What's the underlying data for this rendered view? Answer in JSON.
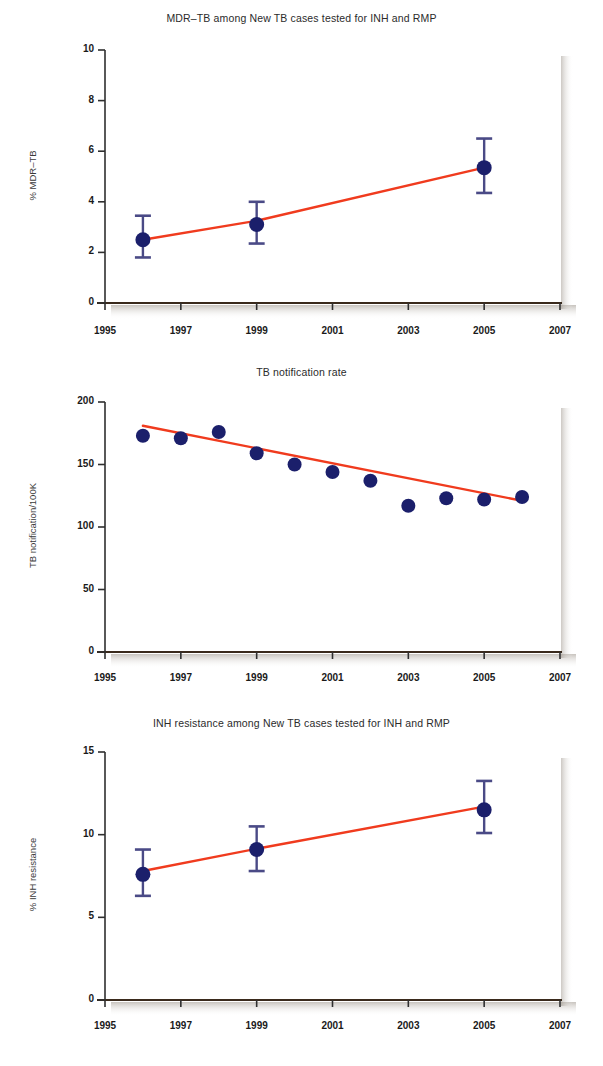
{
  "figure": {
    "background_color": "#ffffff",
    "marker_color": "#1b1f6b",
    "errorbar_color": "#4a4a86",
    "trend_color": "#f03b1e",
    "axis_color": "#3a2a1c",
    "shadow_color": "#b8b0a6"
  },
  "charts": [
    {
      "id": "mdr-tb",
      "title": "MDR–TB among New TB cases tested for INH and RMP",
      "ylabel": "% MDR–TB",
      "xlabel": "",
      "type": "scatter",
      "xlim": [
        1995,
        2007
      ],
      "ylim": [
        0,
        10
      ],
      "xticks": [
        "1995",
        "1997",
        "1999",
        "2001",
        "2003",
        "2005",
        "2007"
      ],
      "xtick_values": [
        1995,
        1997,
        1999,
        2001,
        2003,
        2005,
        2007
      ],
      "yticks": [
        "0",
        "2",
        "4",
        "6",
        "8",
        "10"
      ],
      "ytick_values": [
        0,
        2,
        4,
        6,
        8,
        10
      ],
      "grid": false,
      "legend": "none",
      "x": [
        1996,
        1999,
        2005
      ],
      "values": [
        2.5,
        3.1,
        5.35
      ],
      "err_low": [
        1.8,
        2.35,
        4.35
      ],
      "err_high": [
        3.45,
        4.0,
        6.5
      ],
      "trend": {
        "x": [
          1996,
          1999,
          2005
        ],
        "y": [
          2.5,
          3.25,
          5.35
        ]
      }
    },
    {
      "id": "tb-notification",
      "title": "TB notification rate",
      "ylabel": "TB notification/100K",
      "xlabel": "",
      "type": "scatter",
      "xlim": [
        1995,
        2007
      ],
      "ylim": [
        0,
        200
      ],
      "xticks": [
        "1995",
        "1997",
        "1999",
        "2001",
        "2003",
        "2005",
        "2007"
      ],
      "xtick_values": [
        1995,
        1997,
        1999,
        2001,
        2003,
        2005,
        2007
      ],
      "yticks": [
        "0",
        "50",
        "100",
        "150",
        "200"
      ],
      "ytick_values": [
        0,
        50,
        100,
        150,
        200
      ],
      "grid": false,
      "legend": "none",
      "x": [
        1996,
        1997,
        1998,
        1999,
        2000,
        2001,
        2002,
        2003,
        2004,
        2005,
        2006
      ],
      "values": [
        173,
        171,
        176,
        159,
        150,
        144,
        137,
        117,
        123,
        122,
        124
      ],
      "trend": {
        "x": [
          1996,
          2006
        ],
        "y": [
          181,
          121
        ]
      }
    },
    {
      "id": "inh-resistance",
      "title": "INH resistance among New TB cases tested for INH and RMP",
      "ylabel": "% INH resistance",
      "xlabel": "",
      "type": "scatter",
      "xlim": [
        1995,
        2007
      ],
      "ylim": [
        0,
        15
      ],
      "xticks": [
        "1995",
        "1997",
        "1999",
        "2001",
        "2003",
        "2005",
        "2007"
      ],
      "xtick_values": [
        1995,
        1997,
        1999,
        2001,
        2003,
        2005,
        2007
      ],
      "yticks": [
        "0",
        "5",
        "10",
        "15"
      ],
      "ytick_values": [
        0,
        5,
        10,
        15
      ],
      "grid": false,
      "legend": "none",
      "x": [
        1996,
        1999,
        2005
      ],
      "values": [
        7.6,
        9.1,
        11.5
      ],
      "err_low": [
        6.3,
        7.8,
        10.1
      ],
      "err_high": [
        9.1,
        10.5,
        13.25
      ],
      "trend": {
        "x": [
          1996,
          1999,
          2005
        ],
        "y": [
          7.8,
          9.15,
          11.7
        ]
      }
    }
  ],
  "chart_data": [
    {
      "type": "scatter",
      "title": "MDR–TB among New TB cases tested for INH and RMP",
      "xlabel": "",
      "ylabel": "% MDR–TB",
      "xlim": [
        1995,
        2007
      ],
      "ylim": [
        0,
        10
      ],
      "grid": false,
      "legend": "none",
      "x": [
        1996,
        1999,
        2005
      ],
      "values": [
        2.5,
        3.1,
        5.35
      ],
      "error_low": [
        1.8,
        2.35,
        4.35
      ],
      "error_high": [
        3.45,
        4.0,
        6.5
      ],
      "series": [
        {
          "name": "% MDR-TB (point estimate)",
          "x": [
            1996,
            1999,
            2005
          ],
          "values": [
            2.5,
            3.1,
            5.35
          ]
        },
        {
          "name": "trend line",
          "x": [
            1996,
            1999,
            2005
          ],
          "values": [
            2.5,
            3.25,
            5.35
          ]
        }
      ],
      "xtick_labels": [
        "1995",
        "1997",
        "1999",
        "2001",
        "2003",
        "2005",
        "2007"
      ],
      "ytick_labels": [
        "0",
        "2",
        "4",
        "6",
        "8",
        "10"
      ]
    },
    {
      "type": "scatter",
      "title": "TB notification rate",
      "xlabel": "",
      "ylabel": "TB notification/100K",
      "xlim": [
        1995,
        2007
      ],
      "ylim": [
        0,
        200
      ],
      "grid": false,
      "legend": "none",
      "x": [
        1996,
        1997,
        1998,
        1999,
        2000,
        2001,
        2002,
        2003,
        2004,
        2005,
        2006
      ],
      "values": [
        173,
        171,
        176,
        159,
        150,
        144,
        137,
        117,
        123,
        122,
        124
      ],
      "series": [
        {
          "name": "TB notification rate per 100K",
          "x": [
            1996,
            1997,
            1998,
            1999,
            2000,
            2001,
            2002,
            2003,
            2004,
            2005,
            2006
          ],
          "values": [
            173,
            171,
            176,
            159,
            150,
            144,
            137,
            117,
            123,
            122,
            124
          ]
        },
        {
          "name": "trend line",
          "x": [
            1996,
            2006
          ],
          "values": [
            181,
            121
          ]
        }
      ],
      "xtick_labels": [
        "1995",
        "1997",
        "1999",
        "2001",
        "2003",
        "2005",
        "2007"
      ],
      "ytick_labels": [
        "0",
        "50",
        "100",
        "150",
        "200"
      ]
    },
    {
      "type": "scatter",
      "title": "INH resistance among New TB cases tested for INH and RMP",
      "xlabel": "",
      "ylabel": "% INH resistance",
      "xlim": [
        1995,
        2007
      ],
      "ylim": [
        0,
        15
      ],
      "grid": false,
      "legend": "none",
      "x": [
        1996,
        1999,
        2005
      ],
      "values": [
        7.6,
        9.1,
        11.5
      ],
      "error_low": [
        6.3,
        7.8,
        10.1
      ],
      "error_high": [
        9.1,
        10.5,
        13.25
      ],
      "series": [
        {
          "name": "% INH resistance (point estimate)",
          "x": [
            1996,
            1999,
            2005
          ],
          "values": [
            7.6,
            9.1,
            11.5
          ]
        },
        {
          "name": "trend line",
          "x": [
            1996,
            1999,
            2005
          ],
          "values": [
            7.8,
            9.15,
            11.7
          ]
        }
      ],
      "xtick_labels": [
        "1995",
        "1997",
        "1999",
        "2001",
        "2003",
        "2005",
        "2007"
      ],
      "ytick_labels": [
        "0",
        "5",
        "10",
        "15"
      ]
    }
  ]
}
